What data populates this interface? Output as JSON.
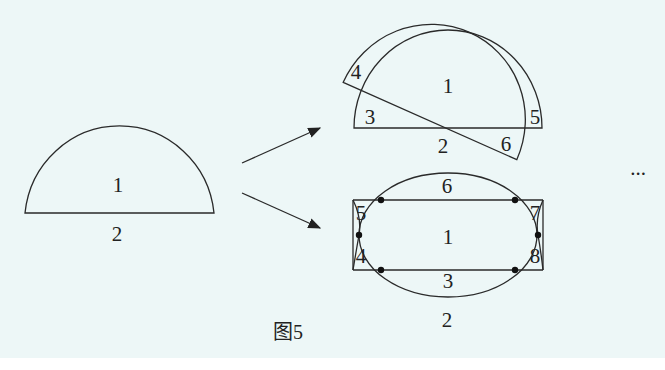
{
  "figure": {
    "caption": "图5",
    "ellipsis": "...",
    "colors": {
      "background": "#edf7f7",
      "stroke": "#2a2a2a",
      "text": "#222222"
    }
  },
  "left_semicircle": {
    "region_labels": {
      "inside": "1",
      "outside": "2"
    }
  },
  "top_right_figure": {
    "description": "Two overlapping semicircles, one rotated",
    "region_labels": [
      "1",
      "2",
      "3",
      "4",
      "5",
      "6"
    ]
  },
  "bottom_right_figure": {
    "description": "Ellipse intersecting rectangle with hourglass side arcs",
    "region_labels": [
      "1",
      "2",
      "3",
      "4",
      "5",
      "6",
      "7",
      "8"
    ],
    "intersection_points": 6
  },
  "arrows": [
    {
      "name": "arrow-up",
      "from": [
        242,
        163
      ],
      "to": [
        320,
        128
      ]
    },
    {
      "name": "arrow-down",
      "from": [
        242,
        193
      ],
      "to": [
        320,
        228
      ]
    }
  ]
}
